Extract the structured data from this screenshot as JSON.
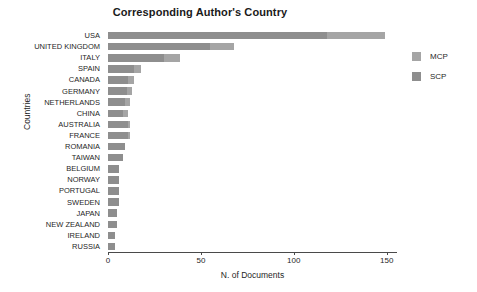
{
  "chart_data": {
    "type": "bar",
    "orientation": "horizontal",
    "stacked": true,
    "title": "Corresponding Author's Country",
    "xlabel": "N. of Documents",
    "ylabel": "Countries",
    "xlim": [
      0,
      155
    ],
    "xticks": [
      0,
      50,
      100,
      150
    ],
    "xtick_labels": [
      "0",
      "50",
      "100",
      "150"
    ],
    "grid": false,
    "legend_position": "right",
    "legend": [
      "MCP",
      "SCP"
    ],
    "categories": [
      "USA",
      "UNITED KINGDOM",
      "ITALY",
      "SPAIN",
      "CANADA",
      "GERMANY",
      "NETHERLANDS",
      "CHINA",
      "AUSTRALIA",
      "FRANCE",
      "ROMANIA",
      "TAIWAN",
      "BELGIUM",
      "NORWAY",
      "PORTUGAL",
      "SWEDEN",
      "JAPAN",
      "NEW ZEALAND",
      "IRELAND",
      "RUSSIA"
    ],
    "series": [
      {
        "name": "SCP",
        "color": "#8e8e8e",
        "values": [
          118,
          55,
          30,
          14,
          11,
          10,
          9,
          8,
          11,
          11,
          9,
          8,
          6,
          6,
          6,
          6,
          5,
          5,
          4,
          4
        ]
      },
      {
        "name": "MCP",
        "color": "#a5a5a5",
        "values": [
          31,
          13,
          9,
          4,
          3,
          3,
          3,
          3,
          1,
          1,
          0,
          0,
          0,
          0,
          0,
          0,
          0,
          0,
          0,
          0
        ]
      }
    ],
    "totals": [
      149,
      68,
      39,
      18,
      14,
      13,
      12,
      11,
      12,
      12,
      9,
      8,
      6,
      6,
      6,
      6,
      5,
      5,
      4,
      4
    ]
  },
  "colors": {
    "mcp": "#a5a5a5",
    "scp": "#8e8e8e",
    "axis": "#4a4a4a",
    "text": "#1f1f1f",
    "background": "#ffffff"
  }
}
